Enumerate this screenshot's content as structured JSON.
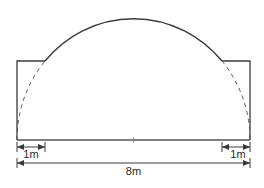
{
  "diagram": {
    "colors": {
      "stroke": "#3a3a3a",
      "background": "#ffffff"
    },
    "dimensions": {
      "left_offset_label": "1m",
      "right_offset_label": "1m",
      "total_width_label": "8m"
    },
    "shapes": {
      "rectangle": "left and right vertical walls with short top ledges",
      "arc": "solid semicircular arc on top; dashed continuation inside side walls",
      "center_mark": "small tick at midpoint of baseline"
    }
  }
}
